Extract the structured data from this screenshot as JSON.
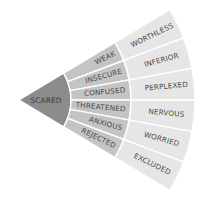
{
  "diagram": {
    "type": "feelings-wheel-segment",
    "colors": {
      "core": "#8c8c8c",
      "middle": "#c4c4c4",
      "outer": "#e6e6e6",
      "divider": "#ffffff",
      "text": "#4a4a4a"
    },
    "core": {
      "label": "SCARED"
    },
    "middle": [
      {
        "label": "WEAK"
      },
      {
        "label": "INSECURE"
      },
      {
        "label": "CONFUSED"
      },
      {
        "label": "THREATENED"
      },
      {
        "label": "ANXIOUS"
      },
      {
        "label": "REJECTED"
      }
    ],
    "outer": [
      {
        "label": "WORTHLESS"
      },
      {
        "label": "INFERIOR"
      },
      {
        "label": "PERPLEXED"
      },
      {
        "label": "NERVOUS"
      },
      {
        "label": "WORRIED"
      },
      {
        "label": "EXCLUDED"
      }
    ]
  }
}
